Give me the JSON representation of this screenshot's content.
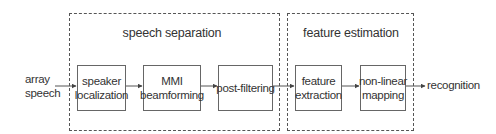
{
  "diagram": {
    "input_label": [
      "array",
      "speech"
    ],
    "output_label": "recognition",
    "groups": [
      {
        "id": "speech-separation",
        "title": "speech separation"
      },
      {
        "id": "feature-estimation",
        "title": "feature estimation"
      }
    ],
    "blocks": [
      {
        "id": "speaker-localization",
        "lines": [
          "speaker",
          "localization"
        ],
        "group": "speech-separation"
      },
      {
        "id": "mmi-beamforming",
        "lines": [
          "MMI",
          "beamforming"
        ],
        "group": "speech-separation"
      },
      {
        "id": "post-filtering",
        "lines": [
          "post-filtering"
        ],
        "group": "speech-separation"
      },
      {
        "id": "feature-extraction",
        "lines": [
          "feature",
          "extraction"
        ],
        "group": "feature-estimation"
      },
      {
        "id": "non-linear-mapping",
        "lines": [
          "non-linear",
          "mapping"
        ],
        "group": "feature-estimation"
      }
    ],
    "edges": [
      [
        "input",
        "speaker-localization"
      ],
      [
        "speaker-localization",
        "mmi-beamforming"
      ],
      [
        "mmi-beamforming",
        "post-filtering"
      ],
      [
        "post-filtering",
        "feature-extraction"
      ],
      [
        "feature-extraction",
        "non-linear-mapping"
      ],
      [
        "non-linear-mapping",
        "output"
      ]
    ]
  }
}
